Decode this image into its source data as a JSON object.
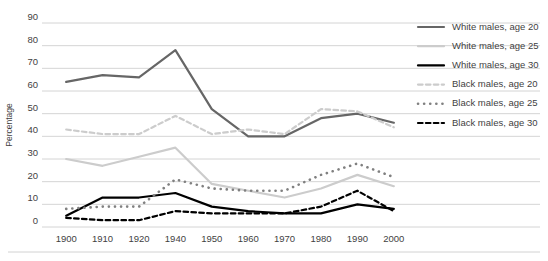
{
  "chart_data": {
    "type": "line",
    "title": "",
    "xlabel": "",
    "ylabel": "Percentage",
    "ylim": [
      0,
      90
    ],
    "ytick_step": 10,
    "grid": true,
    "legend_position": "right",
    "categories": [
      "1900",
      "1910",
      "1920",
      "1940",
      "1950",
      "1960",
      "1970",
      "1980",
      "1990",
      "2000"
    ],
    "yticks": [
      "0",
      "10",
      "20",
      "30",
      "40",
      "50",
      "60",
      "70",
      "80",
      "90"
    ],
    "series": [
      {
        "name": "White males, age 20",
        "style": "solid",
        "color": "#666666",
        "width": 2.2,
        "values": [
          64,
          67,
          66,
          78,
          52,
          40,
          40,
          48,
          50,
          46
        ]
      },
      {
        "name": "White males, age 25",
        "style": "solid",
        "color": "#cccccc",
        "width": 2.2,
        "values": [
          30,
          27,
          31,
          35,
          19,
          16,
          13,
          17,
          23,
          18
        ]
      },
      {
        "name": "White males, age 30",
        "style": "solid",
        "color": "#000000",
        "width": 2.2,
        "values": [
          5,
          13,
          13,
          15,
          9,
          7,
          6,
          6,
          10,
          8
        ]
      },
      {
        "name": "Black males, age 20",
        "style": "dashed",
        "color": "#cccccc",
        "width": 2.2,
        "values": [
          43,
          41,
          41,
          49,
          41,
          43,
          41,
          52,
          51,
          44
        ]
      },
      {
        "name": "Black males, age 25",
        "style": "dotted",
        "color": "#808080",
        "width": 2.6,
        "values": [
          8,
          9,
          9,
          21,
          17,
          16,
          16,
          23,
          28,
          22
        ]
      },
      {
        "name": "Black males, age 30",
        "style": "dashed",
        "color": "#000000",
        "width": 2.2,
        "values": [
          4,
          3,
          3,
          7,
          6,
          6,
          6,
          9,
          16,
          7
        ]
      }
    ]
  },
  "legend": {
    "items": [
      {
        "label": "White males, age 20"
      },
      {
        "label": "White males, age 25"
      },
      {
        "label": "White males, age 30"
      },
      {
        "label": "Black males, age 20"
      },
      {
        "label": "Black males, age 25"
      },
      {
        "label": "Black males, age 30"
      }
    ]
  },
  "colors": {
    "gridline": "#c9c9c9",
    "text": "#3f3f3f",
    "background": "#ffffff",
    "bottom_rule": "#d2d2d2"
  }
}
